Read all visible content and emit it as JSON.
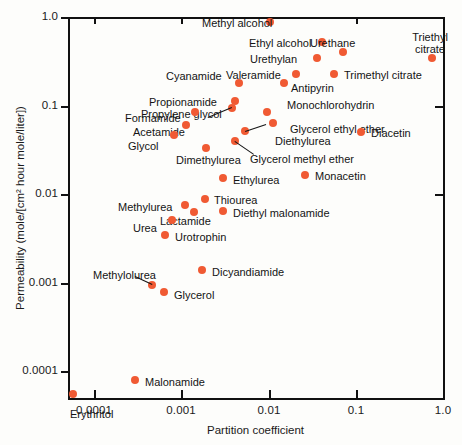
{
  "figure": {
    "background": "#fdfdfb",
    "marker_color": "#f05a33",
    "axis_color": "#111111"
  },
  "chart_data": {
    "type": "scatter",
    "title": "",
    "xlabel": "Partition coefficient",
    "ylabel": "Permeability (mole/[cm² hour mole/liter])",
    "xscale": "log",
    "yscale": "log",
    "xlim": [
      5e-05,
      1.0
    ],
    "ylim": [
      5e-05,
      1.0
    ],
    "xticks": [
      "0.0001",
      "0.001",
      "0.01",
      "0.1",
      "1.0"
    ],
    "xtick_values": [
      0.0001,
      0.001,
      0.01,
      0.1,
      1.0
    ],
    "yticks": [
      "0.0001",
      "0.001",
      "0.01",
      "0.1",
      "1.0"
    ],
    "ytick_values": [
      0.0001,
      0.001,
      0.01,
      0.1,
      1.0
    ],
    "grid": false,
    "legend": "none",
    "points": [
      {
        "name": "Methyl alcohol",
        "x": 0.0052,
        "y": 0.92,
        "px": 270,
        "py": 22,
        "lx": 202,
        "ly": 17,
        "align": "left"
      },
      {
        "name": "Ethyl alcohol",
        "x": 0.018,
        "y": 0.6,
        "px": 322,
        "py": 42,
        "lx": 249,
        "ly": 37,
        "align": "left"
      },
      {
        "name": "Urethane",
        "x": 0.033,
        "y": 0.47,
        "px": 343,
        "py": 52,
        "lx": 310,
        "ly": 37,
        "align": "left"
      },
      {
        "name": "Triethyl citrate",
        "x": 0.72,
        "y": 0.38,
        "px": 432,
        "py": 58,
        "lx": 404,
        "ly": 31,
        "align": "two"
      },
      {
        "name": "Urethylan",
        "x": 0.016,
        "y": 0.38,
        "px": 317,
        "py": 58,
        "lx": 250,
        "ly": 53,
        "align": "left"
      },
      {
        "name": "Trimethyl citrate",
        "x": 0.027,
        "y": 0.25,
        "px": 334,
        "py": 74,
        "lx": 344,
        "ly": 69,
        "align": "left"
      },
      {
        "name": "Valeramide",
        "x": 0.011,
        "y": 0.25,
        "px": 296,
        "py": 74,
        "lx": 226,
        "ly": 69,
        "align": "left"
      },
      {
        "name": "Antipyrin",
        "x": 0.0078,
        "y": 0.2,
        "px": 284,
        "py": 83,
        "lx": 291,
        "ly": 82,
        "align": "left"
      },
      {
        "name": "Cyanamide",
        "x": 0.0022,
        "y": 0.2,
        "px": 239,
        "py": 83,
        "lx": 166,
        "ly": 70,
        "align": "left"
      },
      {
        "name": "Propionamide",
        "x": 0.0019,
        "y": 0.115,
        "px": 235,
        "py": 101,
        "lx": 149,
        "ly": 96,
        "align": "left"
      },
      {
        "name": "Propylene glycol",
        "x": 0.0017,
        "y": 0.093,
        "px": 232,
        "py": 108,
        "lx": 141,
        "ly": 108,
        "align": "left"
      },
      {
        "name": "Monochlorohydrin",
        "x": 0.0047,
        "y": 0.082,
        "px": 267,
        "py": 112,
        "lx": 287,
        "ly": 99,
        "align": "left"
      },
      {
        "name": "Formamide",
        "x": 0.00065,
        "y": 0.082,
        "px": 195,
        "py": 112,
        "lx": 125,
        "ly": 112,
        "align": "left"
      },
      {
        "name": "Acetamide",
        "x": 0.0005,
        "y": 0.057,
        "px": 186,
        "py": 125,
        "lx": 133,
        "ly": 126,
        "align": "left"
      },
      {
        "name": "Glycerol ethyl ether",
        "x": 0.0058,
        "y": 0.06,
        "px": 273,
        "py": 123,
        "lx": 290,
        "ly": 123,
        "align": "left"
      },
      {
        "name": "Diethylurea",
        "x": 0.0026,
        "y": 0.048,
        "px": 245,
        "py": 131,
        "lx": 275,
        "ly": 135,
        "align": "left"
      },
      {
        "name": "Glycol",
        "x": 0.00035,
        "y": 0.042,
        "px": 174,
        "py": 135,
        "lx": 128,
        "ly": 140,
        "align": "left"
      },
      {
        "name": "Glycerol methyl ether",
        "x": 0.0019,
        "y": 0.036,
        "px": 235,
        "py": 141,
        "lx": 250,
        "ly": 153,
        "align": "left"
      },
      {
        "name": "Dimethylurea",
        "x": 0.0009,
        "y": 0.031,
        "px": 206,
        "py": 148,
        "lx": 176,
        "ly": 154,
        "align": "left"
      },
      {
        "name": "Diacetin",
        "x": 0.055,
        "y": 0.046,
        "px": 361,
        "py": 132,
        "lx": 371,
        "ly": 127,
        "align": "left"
      },
      {
        "name": "Monacetin",
        "x": 0.0135,
        "y": 0.0145,
        "px": 305,
        "py": 175,
        "lx": 315,
        "ly": 170,
        "align": "left"
      },
      {
        "name": "Ethylurea",
        "x": 0.0013,
        "y": 0.0135,
        "px": 223,
        "py": 178,
        "lx": 233,
        "ly": 174,
        "align": "left"
      },
      {
        "name": "Thiourea",
        "x": 0.00085,
        "y": 0.0078,
        "px": 205,
        "py": 199,
        "lx": 214,
        "ly": 194,
        "align": "left"
      },
      {
        "name": "Methylurea",
        "x": 0.00048,
        "y": 0.0068,
        "px": 185,
        "py": 205,
        "lx": 118,
        "ly": 201,
        "align": "left"
      },
      {
        "name": "Diethyl malonamide",
        "x": 0.0013,
        "y": 0.0058,
        "px": 223,
        "py": 211,
        "lx": 233,
        "ly": 207,
        "align": "left"
      },
      {
        "name": "Lactamide",
        "x": 0.0006,
        "y": 0.0057,
        "px": 194,
        "py": 212,
        "lx": 160,
        "ly": 215,
        "align": "left"
      },
      {
        "name": "Urea",
        "x": 0.00032,
        "y": 0.0045,
        "px": 172,
        "py": 220,
        "lx": 133,
        "ly": 222,
        "align": "left"
      },
      {
        "name": "Urotrophin",
        "x": 0.00027,
        "y": 0.0031,
        "px": 165,
        "py": 235,
        "lx": 175,
        "ly": 231,
        "align": "left"
      },
      {
        "name": "Dicyandiamide",
        "x": 0.00078,
        "y": 0.0013,
        "px": 202,
        "py": 270,
        "lx": 212,
        "ly": 266,
        "align": "left"
      },
      {
        "name": "Methylolurea",
        "x": 0.00018,
        "y": 0.00092,
        "px": 152,
        "py": 285,
        "lx": 93,
        "ly": 269,
        "align": "left"
      },
      {
        "name": "Glycerol",
        "x": 0.00026,
        "y": 0.00078,
        "px": 164,
        "py": 292,
        "lx": 174,
        "ly": 289,
        "align": "left"
      },
      {
        "name": "Malonamide",
        "x": 0.00011,
        "y": 0.000115,
        "px": 135,
        "py": 380,
        "lx": 145,
        "ly": 376,
        "align": "left"
      },
      {
        "name": "Erythritol",
        "x": 5e-05,
        "y": 4.8e-05,
        "px": 73,
        "py": 394,
        "lx": 70,
        "ly": 408,
        "align": "left"
      }
    ]
  }
}
